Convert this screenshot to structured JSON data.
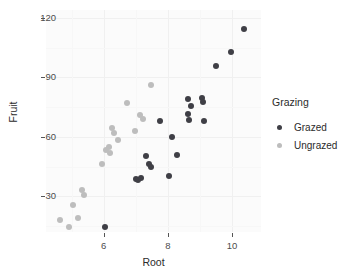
{
  "chart_data": {
    "type": "scatter",
    "title": "",
    "xlabel": "Root",
    "ylabel": "Fruit",
    "xlim": [
      4.2,
      10.9
    ],
    "ylim": [
      12,
      124
    ],
    "xticks": [
      6,
      8,
      10
    ],
    "yticks": [
      30,
      60,
      90,
      120
    ],
    "xtick_labels": [
      "6",
      "8",
      "10"
    ],
    "ytick_labels": [
      "30",
      "60",
      "90",
      "120"
    ],
    "grid": true,
    "legend": {
      "title": "Grazing",
      "position": "right",
      "entries": [
        {
          "label": "Grazed",
          "color": "#3f3f46"
        },
        {
          "label": "Ungrazed",
          "color": "#bdbdbd"
        }
      ]
    },
    "series": [
      {
        "name": "Grazed",
        "color": "#3f3f46",
        "points": [
          {
            "x": 6.03,
            "y": 14.7
          },
          {
            "x": 7.02,
            "y": 38.9
          },
          {
            "x": 7.08,
            "y": 38.0
          },
          {
            "x": 7.16,
            "y": 39.4
          },
          {
            "x": 7.33,
            "y": 50.3
          },
          {
            "x": 7.42,
            "y": 46.2
          },
          {
            "x": 7.47,
            "y": 45.0
          },
          {
            "x": 7.75,
            "y": 68.0
          },
          {
            "x": 8.02,
            "y": 40.1
          },
          {
            "x": 8.12,
            "y": 60.0
          },
          {
            "x": 8.28,
            "y": 51.0
          },
          {
            "x": 8.61,
            "y": 79.0
          },
          {
            "x": 8.64,
            "y": 71.5
          },
          {
            "x": 8.66,
            "y": 68.5
          },
          {
            "x": 8.72,
            "y": 75.4
          },
          {
            "x": 9.05,
            "y": 79.4
          },
          {
            "x": 9.1,
            "y": 77.8
          },
          {
            "x": 9.13,
            "y": 68.2
          },
          {
            "x": 9.5,
            "y": 96.0
          },
          {
            "x": 9.96,
            "y": 103.0
          },
          {
            "x": 10.37,
            "y": 114.5
          }
        ]
      },
      {
        "name": "Ungrazed",
        "color": "#bdbdbd",
        "points": [
          {
            "x": 4.63,
            "y": 17.9
          },
          {
            "x": 4.93,
            "y": 14.7
          },
          {
            "x": 5.05,
            "y": 25.8
          },
          {
            "x": 5.2,
            "y": 19.2
          },
          {
            "x": 5.32,
            "y": 33.3
          },
          {
            "x": 5.39,
            "y": 30.5
          },
          {
            "x": 5.93,
            "y": 46.2
          },
          {
            "x": 6.08,
            "y": 53.3
          },
          {
            "x": 6.16,
            "y": 55.0
          },
          {
            "x": 6.2,
            "y": 51.9
          },
          {
            "x": 6.26,
            "y": 64.6
          },
          {
            "x": 6.33,
            "y": 62.1
          },
          {
            "x": 6.43,
            "y": 58.4
          },
          {
            "x": 6.71,
            "y": 77.0
          },
          {
            "x": 6.98,
            "y": 63.2
          },
          {
            "x": 7.13,
            "y": 71.0
          },
          {
            "x": 7.22,
            "y": 69.0
          },
          {
            "x": 7.48,
            "y": 86.0
          }
        ]
      }
    ]
  },
  "axes": {
    "x_title": "Root",
    "y_title": "Fruit"
  }
}
